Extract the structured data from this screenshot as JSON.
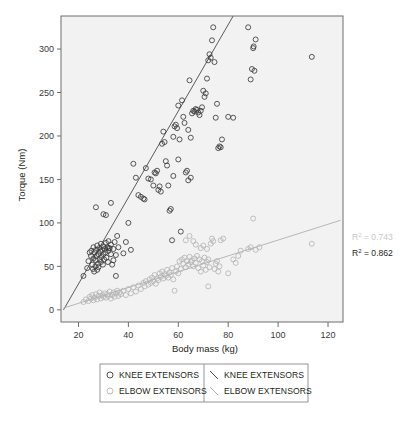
{
  "chart_data": {
    "type": "scatter",
    "title": "",
    "xlabel": "Body mass (kg)",
    "ylabel": "Torque (Nm)",
    "xlim": [
      13,
      126
    ],
    "ylim": [
      -14,
      338
    ],
    "xticks": [
      20,
      40,
      60,
      80,
      100,
      120
    ],
    "yticks": [
      0,
      50,
      100,
      150,
      200,
      250,
      300
    ],
    "grid": false,
    "legend_position": "below-axes",
    "plot_bgcolor": "#f2f2f2",
    "series": [
      {
        "name": "KNEE EXTENSORS",
        "marker": "open-circle",
        "color": "#3b3b3b",
        "points": [
          [
            22.0,
            39
          ],
          [
            23.5,
            48
          ],
          [
            24.0,
            56
          ],
          [
            24.5,
            66
          ],
          [
            25.0,
            62
          ],
          [
            25.2,
            68
          ],
          [
            25.5,
            52
          ],
          [
            25.8,
            47
          ],
          [
            26.0,
            59
          ],
          [
            26.0,
            72
          ],
          [
            26.3,
            44
          ],
          [
            26.5,
            66
          ],
          [
            26.8,
            50
          ],
          [
            27.0,
            57
          ],
          [
            27.0,
            69
          ],
          [
            27.2,
            62
          ],
          [
            27.5,
            74
          ],
          [
            27.5,
            46
          ],
          [
            27.8,
            53
          ],
          [
            28.0,
            64
          ],
          [
            28.0,
            49
          ],
          [
            28.3,
            71
          ],
          [
            28.5,
            58
          ],
          [
            28.8,
            67
          ],
          [
            29.0,
            55
          ],
          [
            29.0,
            76
          ],
          [
            29.2,
            61
          ],
          [
            29.5,
            69
          ],
          [
            29.8,
            52
          ],
          [
            30.0,
            64
          ],
          [
            30.0,
            73
          ],
          [
            30.3,
            58
          ],
          [
            30.5,
            70
          ],
          [
            30.8,
            66
          ],
          [
            31.0,
            77
          ],
          [
            31.2,
            60
          ],
          [
            31.5,
            72
          ],
          [
            31.8,
            55
          ],
          [
            32.0,
            68
          ],
          [
            32.0,
            79
          ],
          [
            32.5,
            71
          ],
          [
            33.0,
            64
          ],
          [
            33.0,
            75
          ],
          [
            33.5,
            52
          ],
          [
            34.0,
            70
          ],
          [
            34.0,
            57
          ],
          [
            34.5,
            78
          ],
          [
            35.0,
            39
          ],
          [
            35.0,
            63
          ],
          [
            35.5,
            85
          ],
          [
            36.0,
            72
          ],
          [
            27.0,
            118
          ],
          [
            30.0,
            110
          ],
          [
            31.0,
            109
          ],
          [
            32.0,
            71
          ],
          [
            33.0,
            123
          ],
          [
            38.0,
            65
          ],
          [
            39.0,
            78
          ],
          [
            40.0,
            100
          ],
          [
            41.0,
            69
          ],
          [
            43.0,
            152
          ],
          [
            44.0,
            132
          ],
          [
            45.0,
            130
          ],
          [
            46.0,
            128
          ],
          [
            46.5,
            127
          ],
          [
            42.0,
            168
          ],
          [
            47.0,
            163
          ],
          [
            48.0,
            151
          ],
          [
            49.0,
            150
          ],
          [
            50.0,
            143
          ],
          [
            50.5,
            158
          ],
          [
            51.0,
            157
          ],
          [
            51.5,
            160
          ],
          [
            52.0,
            138
          ],
          [
            52.5,
            142
          ],
          [
            53.0,
            136
          ],
          [
            53.5,
            191
          ],
          [
            54.0,
            205
          ],
          [
            54.5,
            193
          ],
          [
            55.0,
            171
          ],
          [
            55.5,
            166
          ],
          [
            56.0,
            143
          ],
          [
            56.5,
            114
          ],
          [
            57.0,
            116
          ],
          [
            57.5,
            80
          ],
          [
            58.0,
            199
          ],
          [
            58.5,
            211
          ],
          [
            59.0,
            213
          ],
          [
            59.5,
            209
          ],
          [
            60.0,
            235
          ],
          [
            60.5,
            196
          ],
          [
            61.0,
            90
          ],
          [
            61.5,
            241
          ],
          [
            62.0,
            222
          ],
          [
            62.5,
            215
          ],
          [
            63.0,
            158
          ],
          [
            63.5,
            160
          ],
          [
            64.0,
            207
          ],
          [
            64.5,
            264
          ],
          [
            65.0,
            198
          ],
          [
            65.5,
            226
          ],
          [
            66.0,
            229
          ],
          [
            66.5,
            228
          ],
          [
            67.0,
            231
          ],
          [
            67.5,
            230
          ],
          [
            68.0,
            227
          ],
          [
            68.5,
            224
          ],
          [
            69.0,
            229
          ],
          [
            69.5,
            233
          ],
          [
            70.0,
            252
          ],
          [
            70.5,
            245
          ],
          [
            71.0,
            249
          ],
          [
            71.5,
            266
          ],
          [
            72.0,
            287
          ],
          [
            72.5,
            294
          ],
          [
            73.0,
            290
          ],
          [
            73.5,
            310
          ],
          [
            74.0,
            325
          ],
          [
            74.5,
            285
          ],
          [
            75.0,
            221
          ],
          [
            75.5,
            237
          ],
          [
            76.0,
            186
          ],
          [
            76.5,
            188
          ],
          [
            77.0,
            187
          ],
          [
            64.0,
            149
          ],
          [
            65.0,
            152
          ],
          [
            60.0,
            173
          ],
          [
            58.0,
            154
          ],
          [
            77.5,
            196
          ],
          [
            80.0,
            222
          ],
          [
            82.0,
            221
          ],
          [
            89.0,
            265
          ],
          [
            89.5,
            277
          ],
          [
            90.0,
            301
          ],
          [
            90.2,
            303
          ],
          [
            90.5,
            275
          ],
          [
            88.0,
            325
          ],
          [
            91.0,
            311
          ],
          [
            113.5,
            291
          ]
        ]
      },
      {
        "name": "ELBOW EXTENSORS",
        "marker": "open-circle",
        "color": "#b5b5b5",
        "points": [
          [
            22.0,
            9
          ],
          [
            23.0,
            12
          ],
          [
            24.0,
            10
          ],
          [
            24.5,
            15
          ],
          [
            25.0,
            13
          ],
          [
            25.5,
            17
          ],
          [
            26.0,
            11
          ],
          [
            26.5,
            14
          ],
          [
            27.0,
            18
          ],
          [
            27.5,
            12
          ],
          [
            28.0,
            16
          ],
          [
            28.5,
            20
          ],
          [
            29.0,
            13
          ],
          [
            29.5,
            17
          ],
          [
            30.0,
            15
          ],
          [
            30.5,
            19
          ],
          [
            31.0,
            14
          ],
          [
            31.5,
            18
          ],
          [
            32.0,
            16
          ],
          [
            32.5,
            21
          ],
          [
            33.0,
            13
          ],
          [
            33.5,
            17
          ],
          [
            34.0,
            20
          ],
          [
            34.5,
            15
          ],
          [
            35.0,
            19
          ],
          [
            35.5,
            22
          ],
          [
            36.0,
            16
          ],
          [
            36.5,
            20
          ],
          [
            37.0,
            18
          ],
          [
            38.0,
            22
          ],
          [
            39.0,
            17
          ],
          [
            40.0,
            24
          ],
          [
            41.0,
            19
          ],
          [
            42.0,
            26
          ],
          [
            43.0,
            21
          ],
          [
            44.0,
            28
          ],
          [
            45.0,
            24
          ],
          [
            46.0,
            31
          ],
          [
            46.5,
            27
          ],
          [
            47.0,
            33
          ],
          [
            48.0,
            29
          ],
          [
            48.5,
            35
          ],
          [
            49.0,
            31
          ],
          [
            49.5,
            37
          ],
          [
            50.0,
            33
          ],
          [
            50.5,
            40
          ],
          [
            51.0,
            30
          ],
          [
            51.5,
            36
          ],
          [
            52.0,
            34
          ],
          [
            52.5,
            42
          ],
          [
            53.0,
            38
          ],
          [
            53.5,
            44
          ],
          [
            54.0,
            36
          ],
          [
            54.5,
            41
          ],
          [
            55.0,
            39
          ],
          [
            55.5,
            46
          ],
          [
            56.0,
            37
          ],
          [
            56.5,
            43
          ],
          [
            57.0,
            40
          ],
          [
            57.5,
            48
          ],
          [
            58.0,
            35
          ],
          [
            58.5,
            22
          ],
          [
            59.0,
            44
          ],
          [
            59.5,
            50
          ],
          [
            60.0,
            42
          ],
          [
            60.5,
            56
          ],
          [
            61.0,
            47
          ],
          [
            61.5,
            58
          ],
          [
            62.0,
            53
          ],
          [
            62.5,
            60
          ],
          [
            63.0,
            49
          ],
          [
            63.5,
            56
          ],
          [
            64.0,
            52
          ],
          [
            64.5,
            61
          ],
          [
            65.0,
            55
          ],
          [
            65.5,
            57
          ],
          [
            66.0,
            50
          ],
          [
            66.5,
            59
          ],
          [
            67.0,
            54
          ],
          [
            67.5,
            62
          ],
          [
            68.0,
            48
          ],
          [
            68.5,
            58
          ],
          [
            69.0,
            44
          ],
          [
            69.5,
            56
          ],
          [
            70.0,
            51
          ],
          [
            70.5,
            60
          ],
          [
            71.0,
            46
          ],
          [
            71.5,
            55
          ],
          [
            72.0,
            58
          ],
          [
            72.5,
            49
          ],
          [
            73.0,
            76
          ],
          [
            73.5,
            82
          ],
          [
            74.0,
            79
          ],
          [
            74.5,
            47
          ],
          [
            75.0,
            53
          ],
          [
            75.5,
            56
          ],
          [
            76.0,
            44
          ],
          [
            76.5,
            50
          ],
          [
            77.0,
            80
          ],
          [
            78.0,
            82
          ],
          [
            63.0,
            80
          ],
          [
            64.5,
            85
          ],
          [
            66.0,
            79
          ],
          [
            67.0,
            75
          ],
          [
            69.0,
            71
          ],
          [
            70.0,
            74
          ],
          [
            71.5,
            70
          ],
          [
            72.0,
            27
          ],
          [
            80.0,
            42
          ],
          [
            82.0,
            58
          ],
          [
            83.0,
            54
          ],
          [
            84.0,
            62
          ],
          [
            85.0,
            68
          ],
          [
            88.0,
            70
          ],
          [
            89.0,
            72
          ],
          [
            90.0,
            105
          ],
          [
            91.0,
            69
          ],
          [
            92.5,
            72
          ],
          [
            113.5,
            76
          ]
        ]
      }
    ],
    "trendlines": [
      {
        "name": "KNEE EXTENSORS",
        "color": "#4a4a4a",
        "x0": 14.0,
        "y0": 0,
        "x1": 82.0,
        "y1": 338
      },
      {
        "name": "ELBOW EXTENSORS",
        "color": "#b0b0b0",
        "x0": 14.0,
        "y0": 2,
        "x1": 125.0,
        "y1": 103
      }
    ],
    "annotations": [
      {
        "label": "R",
        "sup": "2",
        "eq": " = 0.743",
        "color": "#c9c9c9"
      },
      {
        "label": "R",
        "sup": "2",
        "eq": " = 0.862",
        "color": "#231f20"
      }
    ]
  },
  "legend": {
    "rows": [
      {
        "marker_label": "KNEE EXTENSORS",
        "line_label": "KNEE EXTENSORS",
        "marker_color": "#3b3b3b",
        "line_color": "#4a4a4a"
      },
      {
        "marker_label": "ELBOW EXTENSORS",
        "line_label": "ELBOW EXTENSORS",
        "marker_color": "#b5b5b5",
        "line_color": "#b0b0b0"
      }
    ]
  },
  "caption": {
    "text": ""
  }
}
